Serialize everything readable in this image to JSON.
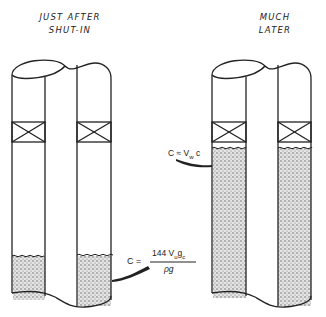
{
  "diagram": {
    "panels": [
      {
        "id": "left",
        "title_line1": "JUST AFTER",
        "title_line2": "SHUT-IN",
        "fluid_level_y": 256,
        "equation": {
          "lhs": "C =",
          "numerator": "144 V",
          "numerator_sub": "u",
          "numerator_tail": "g",
          "numerator_tail_sub": "c",
          "denominator": "ρg"
        }
      },
      {
        "id": "right",
        "title_line1": "MUCH",
        "title_line2": "LATER",
        "fluid_level_y": 148,
        "equation": {
          "lhs": "C ≈ V",
          "lhs_sub": "w",
          "rhs": " c"
        }
      }
    ],
    "colors": {
      "line": "#222222",
      "fluid_dot": "#555555",
      "background": "#ffffff"
    }
  }
}
